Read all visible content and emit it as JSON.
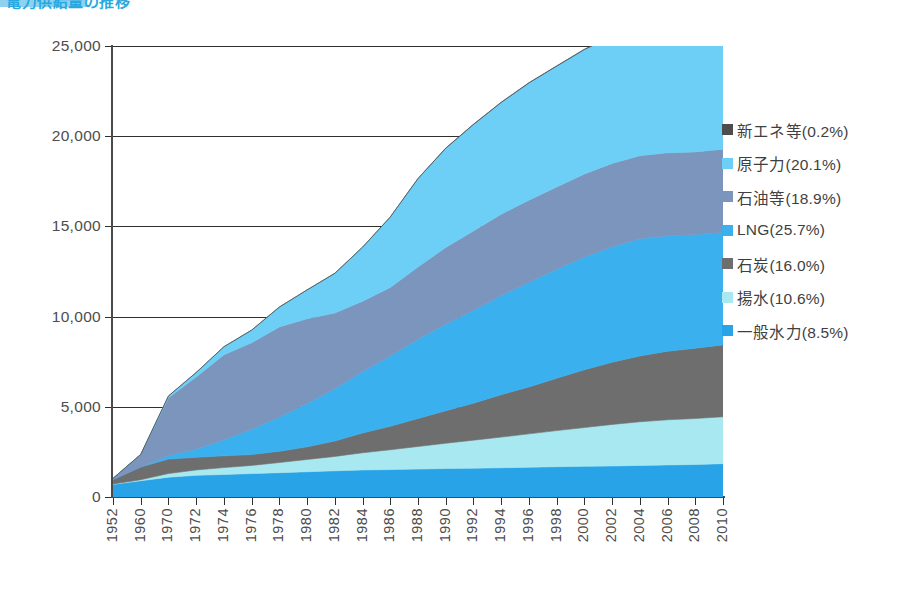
{
  "header": {
    "title": "電力供給量の推移",
    "badge_label": "図表"
  },
  "legend": {
    "position": "right",
    "items": [
      {
        "label": "新エネ等(0.2%)",
        "key": "新エネ等",
        "percent": 0.2,
        "color": "#4d4d4d"
      },
      {
        "label": "原子力(20.1%)",
        "key": "原子力",
        "percent": 20.1,
        "color": "#6dcff6"
      },
      {
        "label": "石油等(18.9%)",
        "key": "石油等",
        "percent": 18.9,
        "color": "#7b95bd"
      },
      {
        "label": "LNG(25.7%)",
        "key": "LNG",
        "percent": 25.7,
        "color": "#3bb0ee"
      },
      {
        "label": "石炭(16.0%)",
        "key": "石炭",
        "percent": 16.0,
        "color": "#6e6e6e"
      },
      {
        "label": "揚水(10.6%)",
        "key": "揚水",
        "percent": 10.6,
        "color": "#a8e8f0"
      },
      {
        "label": "一般水力(8.5%)",
        "key": "一般水力",
        "percent": 8.5,
        "color": "#29a3e8"
      }
    ]
  },
  "axes": {
    "y_ticks": [
      "0",
      "5,000",
      "10,000",
      "15,000",
      "20,000",
      "25,000"
    ],
    "y_values": [
      0,
      5000,
      10000,
      15000,
      20000,
      25000
    ],
    "ylim": [
      0,
      25000
    ],
    "ylabel": "",
    "xlabel": "",
    "x_ticks": [
      "1952",
      "1960",
      "1970",
      "1972",
      "1974",
      "1976",
      "1978",
      "1980",
      "1982",
      "1984",
      "1986",
      "1988",
      "1990",
      "1992",
      "1994",
      "1996",
      "1998",
      "2000",
      "2002",
      "2004",
      "2006",
      "2008",
      "2010"
    ]
  },
  "chart_data": {
    "type": "area",
    "title": "電力供給量の推移",
    "xlabel": "",
    "ylabel": "",
    "ylim": [
      0,
      25000
    ],
    "grid": true,
    "legend_position": "right",
    "stacked": true,
    "categories": [
      "1952",
      "1960",
      "1970",
      "1972",
      "1974",
      "1976",
      "1978",
      "1980",
      "1982",
      "1984",
      "1986",
      "1988",
      "1990",
      "1992",
      "1994",
      "1996",
      "1998",
      "2000",
      "2002",
      "2004",
      "2006",
      "2008",
      "2010"
    ],
    "x": [
      1952,
      1960,
      1970,
      1972,
      1974,
      1976,
      1978,
      1980,
      1982,
      1984,
      1986,
      1988,
      1990,
      1992,
      1994,
      1996,
      1998,
      2000,
      2002,
      2004,
      2006,
      2008,
      2010
    ],
    "series": [
      {
        "name": "一般水力",
        "color": "#29a3e8",
        "values": [
          700,
          900,
          1100,
          1200,
          1250,
          1300,
          1350,
          1400,
          1450,
          1500,
          1520,
          1550,
          1580,
          1600,
          1620,
          1650,
          1680,
          1700,
          1720,
          1750,
          1780,
          1800,
          1850
        ]
      },
      {
        "name": "揚水",
        "color": "#a8e8f0",
        "values": [
          20,
          60,
          200,
          300,
          380,
          450,
          560,
          680,
          800,
          950,
          1100,
          1250,
          1400,
          1550,
          1700,
          1850,
          2000,
          2150,
          2300,
          2420,
          2500,
          2550,
          2600
        ]
      },
      {
        "name": "石炭",
        "color": "#6e6e6e",
        "values": [
          250,
          700,
          800,
          700,
          650,
          600,
          620,
          700,
          850,
          1100,
          1300,
          1550,
          1800,
          2050,
          2350,
          2600,
          2900,
          3200,
          3450,
          3650,
          3800,
          3900,
          3980
        ]
      },
      {
        "name": "LNG",
        "color": "#3bb0ee",
        "values": [
          0,
          0,
          200,
          450,
          900,
          1400,
          1900,
          2400,
          2900,
          3400,
          3900,
          4400,
          4800,
          5150,
          5500,
          5800,
          6050,
          6250,
          6400,
          6500,
          6400,
          6300,
          6250
        ]
      },
      {
        "name": "石油等",
        "color": "#7b95bd",
        "values": [
          60,
          700,
          3200,
          4000,
          4700,
          4800,
          5000,
          4700,
          4200,
          3900,
          3800,
          4000,
          4250,
          4400,
          4500,
          4550,
          4550,
          4600,
          4620,
          4600,
          4600,
          4580,
          4600
        ]
      },
      {
        "name": "原子力",
        "color": "#6dcff6",
        "values": [
          0,
          0,
          100,
          250,
          450,
          700,
          1100,
          1600,
          2200,
          3000,
          3900,
          4900,
          5500,
          5900,
          6200,
          6500,
          6700,
          6900,
          7050,
          7150,
          7200,
          7230,
          7280
        ]
      },
      {
        "name": "新エネ等",
        "color": "#4d4d4d",
        "values": [
          0,
          0,
          0,
          0,
          0,
          0,
          0,
          0,
          0,
          0,
          5,
          8,
          10,
          12,
          14,
          16,
          18,
          22,
          26,
          30,
          34,
          40,
          50
        ]
      }
    ],
    "totals": [
      1030,
      2360,
      5600,
      6900,
      8330,
      9250,
      10530,
      11480,
      12400,
      13850,
      15525,
      17658,
      19340,
      20662,
      21884,
      22966,
      23898,
      24822,
      25566,
      26100,
      26314,
      26400,
      26610
    ]
  }
}
